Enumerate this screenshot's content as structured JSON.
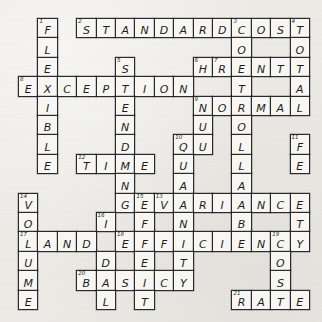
{
  "puzzle": {
    "title": "Accounting Terms Crossword",
    "grid": {
      "cols": 15,
      "rows": 15,
      "cell_size": 19.4,
      "origin_x": 18,
      "origin_y": 18
    },
    "colors": {
      "paper": "#ecebe6",
      "cell": "#f7f6f2",
      "ink": "#1d1d1d",
      "border": "#2a2a2a"
    },
    "entries": [
      {
        "number": 1,
        "direction": "down",
        "answer": "FLEXIBLE",
        "row": 0,
        "col": 1
      },
      {
        "number": 2,
        "direction": "across",
        "answer": "STANDARDCOST",
        "row": 0,
        "col": 3
      },
      {
        "number": 3,
        "direction": "down",
        "answer": "CONTROLLABLE",
        "row": 0,
        "col": 11
      },
      {
        "number": 4,
        "direction": "down",
        "answer": "TOTAL",
        "row": 0,
        "col": 14
      },
      {
        "number": 5,
        "direction": "down",
        "answer": "SPENDING",
        "row": 2,
        "col": 5
      },
      {
        "number": 6,
        "direction": "down",
        "answer": "HOUR",
        "row": 2,
        "col": 9
      },
      {
        "number": 7,
        "direction": "across",
        "answer": "RENT",
        "row": 2,
        "col": 9
      },
      {
        "number": 8,
        "direction": "across",
        "answer": "EXCEPTION",
        "row": 3,
        "col": 0
      },
      {
        "number": 9,
        "direction": "across",
        "answer": "NORMAL",
        "row": 4,
        "col": 9
      },
      {
        "number": 10,
        "direction": "down",
        "answer": "QUANTITY",
        "row": 6,
        "col": 8
      },
      {
        "number": 11,
        "direction": "down",
        "answer": "FEET",
        "row": 6,
        "col": 14
      },
      {
        "number": 12,
        "direction": "across",
        "answer": "TIME",
        "row": 7,
        "col": 3
      },
      {
        "number": 13,
        "direction": "across",
        "answer": "VARIANCE",
        "row": 9,
        "col": 7
      },
      {
        "number": 14,
        "direction": "down",
        "answer": "VOLUME",
        "row": 9,
        "col": 0
      },
      {
        "number": 15,
        "direction": "down",
        "answer": "EFFECT",
        "row": 9,
        "col": 6
      },
      {
        "number": 16,
        "direction": "down",
        "answer": "IDEAL",
        "row": 10,
        "col": 4
      },
      {
        "number": 17,
        "direction": "across",
        "answer": "LAND",
        "row": 11,
        "col": 0
      },
      {
        "number": 18,
        "direction": "across",
        "answer": "EFFICIENCY",
        "row": 11,
        "col": 5
      },
      {
        "number": 19,
        "direction": "down",
        "answer": "COST",
        "row": 11,
        "col": 13
      },
      {
        "number": 20,
        "direction": "across",
        "answer": "BASIC",
        "row": 12,
        "col": 3
      },
      {
        "number": 21,
        "direction": "across",
        "answer": "RATE",
        "row": 13,
        "col": 11
      }
    ],
    "cells": [
      {
        "r": 0,
        "c": 1,
        "l": "F",
        "n": 1
      },
      {
        "r": 0,
        "c": 3,
        "l": "S",
        "n": 2
      },
      {
        "r": 0,
        "c": 4,
        "l": "T"
      },
      {
        "r": 0,
        "c": 5,
        "l": "A"
      },
      {
        "r": 0,
        "c": 6,
        "l": "N"
      },
      {
        "r": 0,
        "c": 7,
        "l": "D"
      },
      {
        "r": 0,
        "c": 8,
        "l": "A"
      },
      {
        "r": 0,
        "c": 9,
        "l": "R"
      },
      {
        "r": 0,
        "c": 10,
        "l": "D"
      },
      {
        "r": 0,
        "c": 11,
        "l": "C",
        "n": 3
      },
      {
        "r": 0,
        "c": 12,
        "l": "O"
      },
      {
        "r": 0,
        "c": 13,
        "l": "S"
      },
      {
        "r": 0,
        "c": 14,
        "l": "T",
        "n": 4
      },
      {
        "r": 1,
        "c": 1,
        "l": "L"
      },
      {
        "r": 1,
        "c": 11,
        "l": "O"
      },
      {
        "r": 1,
        "c": 14,
        "l": "O"
      },
      {
        "r": 2,
        "c": 1,
        "l": "E"
      },
      {
        "r": 2,
        "c": 5,
        "l": "S",
        "n": 5
      },
      {
        "r": 2,
        "c": 9,
        "l": "H",
        "n": 6
      },
      {
        "r": 2,
        "c": 10,
        "l": "R",
        "n": 7
      },
      {
        "r": 2,
        "c": 11,
        "l": "E"
      },
      {
        "r": 2,
        "c": 12,
        "l": "N"
      },
      {
        "r": 2,
        "c": 13,
        "l": "T"
      },
      {
        "r": 2,
        "c": 14,
        "l": "T"
      },
      {
        "r": 3,
        "c": 0,
        "l": "E",
        "n": 8
      },
      {
        "r": 3,
        "c": 1,
        "l": "X"
      },
      {
        "r": 3,
        "c": 2,
        "l": "C"
      },
      {
        "r": 3,
        "c": 3,
        "l": "E"
      },
      {
        "r": 3,
        "c": 4,
        "l": "P"
      },
      {
        "r": 3,
        "c": 5,
        "l": "T"
      },
      {
        "r": 3,
        "c": 6,
        "l": "I"
      },
      {
        "r": 3,
        "c": 7,
        "l": "O"
      },
      {
        "r": 3,
        "c": 8,
        "l": "N"
      },
      {
        "r": 3,
        "c": 11,
        "l": "T"
      },
      {
        "r": 3,
        "c": 14,
        "l": "A"
      },
      {
        "r": 4,
        "c": 1,
        "l": "I"
      },
      {
        "r": 4,
        "c": 5,
        "l": "E"
      },
      {
        "r": 4,
        "c": 9,
        "l": "N",
        "n": 9
      },
      {
        "r": 4,
        "c": 10,
        "l": "O"
      },
      {
        "r": 4,
        "c": 11,
        "l": "R"
      },
      {
        "r": 4,
        "c": 12,
        "l": "M"
      },
      {
        "r": 4,
        "c": 13,
        "l": "A"
      },
      {
        "r": 4,
        "c": 14,
        "l": "L"
      },
      {
        "r": 5,
        "c": 1,
        "l": "B"
      },
      {
        "r": 5,
        "c": 5,
        "l": "N"
      },
      {
        "r": 5,
        "c": 9,
        "l": "U"
      },
      {
        "r": 5,
        "c": 11,
        "l": "O"
      },
      {
        "r": 6,
        "c": 1,
        "l": "L"
      },
      {
        "r": 6,
        "c": 5,
        "l": "D"
      },
      {
        "r": 6,
        "c": 8,
        "l": "Q",
        "n": 10
      },
      {
        "r": 6,
        "c": 9,
        "l": "U"
      },
      {
        "r": 6,
        "c": 11,
        "l": "L"
      },
      {
        "r": 6,
        "c": 14,
        "l": "F",
        "n": 11
      },
      {
        "r": 7,
        "c": 1,
        "l": "E"
      },
      {
        "r": 7,
        "c": 3,
        "l": "T",
        "n": 12
      },
      {
        "r": 7,
        "c": 4,
        "l": "I"
      },
      {
        "r": 7,
        "c": 5,
        "l": "M"
      },
      {
        "r": 7,
        "c": 6,
        "l": "E"
      },
      {
        "r": 7,
        "c": 8,
        "l": "U"
      },
      {
        "r": 7,
        "c": 11,
        "l": "L"
      },
      {
        "r": 7,
        "c": 14,
        "l": "E"
      },
      {
        "r": 8,
        "c": 5,
        "l": "N"
      },
      {
        "r": 8,
        "c": 8,
        "l": "A"
      },
      {
        "r": 8,
        "c": 11,
        "l": "A"
      },
      {
        "r": 9,
        "c": 0,
        "l": "V",
        "n": 14
      },
      {
        "r": 9,
        "c": 5,
        "l": "G"
      },
      {
        "r": 9,
        "c": 6,
        "l": "E",
        "n": 15
      },
      {
        "r": 9,
        "c": 7,
        "l": "V",
        "n": 13
      },
      {
        "r": 9,
        "c": 8,
        "l": "A"
      },
      {
        "r": 9,
        "c": 9,
        "l": "R"
      },
      {
        "r": 9,
        "c": 10,
        "l": "I"
      },
      {
        "r": 9,
        "c": 11,
        "l": "A"
      },
      {
        "r": 9,
        "c": 12,
        "l": "N"
      },
      {
        "r": 9,
        "c": 13,
        "l": "C"
      },
      {
        "r": 9,
        "c": 14,
        "l": "E"
      },
      {
        "r": 10,
        "c": 0,
        "l": "O"
      },
      {
        "r": 10,
        "c": 4,
        "l": "I",
        "n": 16
      },
      {
        "r": 10,
        "c": 6,
        "l": "F"
      },
      {
        "r": 10,
        "c": 8,
        "l": "N"
      },
      {
        "r": 10,
        "c": 11,
        "l": "B"
      },
      {
        "r": 10,
        "c": 14,
        "l": "T"
      },
      {
        "r": 11,
        "c": 0,
        "l": "L",
        "n": 17
      },
      {
        "r": 11,
        "c": 1,
        "l": "A"
      },
      {
        "r": 11,
        "c": 2,
        "l": "N"
      },
      {
        "r": 11,
        "c": 3,
        "l": "D"
      },
      {
        "r": 11,
        "c": 5,
        "l": "E",
        "n": 18
      },
      {
        "r": 11,
        "c": 6,
        "l": "F"
      },
      {
        "r": 11,
        "c": 7,
        "l": "F"
      },
      {
        "r": 11,
        "c": 8,
        "l": "I"
      },
      {
        "r": 11,
        "c": 9,
        "l": "C"
      },
      {
        "r": 11,
        "c": 10,
        "l": "I"
      },
      {
        "r": 11,
        "c": 11,
        "l": "E"
      },
      {
        "r": 11,
        "c": 12,
        "l": "N"
      },
      {
        "r": 11,
        "c": 13,
        "l": "C",
        "n": 19
      },
      {
        "r": 11,
        "c": 14,
        "l": "Y"
      },
      {
        "r": 12,
        "c": 0,
        "l": "U"
      },
      {
        "r": 12,
        "c": 4,
        "l": "D"
      },
      {
        "r": 12,
        "c": 6,
        "l": "E"
      },
      {
        "r": 12,
        "c": 8,
        "l": "T"
      },
      {
        "r": 12,
        "c": 13,
        "l": "O"
      },
      {
        "r": 13,
        "c": 0,
        "l": "M"
      },
      {
        "r": 13,
        "c": 3,
        "l": "B",
        "n": 20
      },
      {
        "r": 13,
        "c": 4,
        "l": "A"
      },
      {
        "r": 13,
        "c": 5,
        "l": "S"
      },
      {
        "r": 13,
        "c": 6,
        "l": "I"
      },
      {
        "r": 13,
        "c": 7,
        "l": "C"
      },
      {
        "r": 13,
        "c": 8,
        "l": "Y"
      },
      {
        "r": 13,
        "c": 13,
        "l": "S"
      },
      {
        "r": 14,
        "c": 0,
        "l": "E"
      },
      {
        "r": 14,
        "c": 4,
        "l": "L"
      },
      {
        "r": 14,
        "c": 6,
        "l": "T"
      },
      {
        "r": 14,
        "c": 11,
        "l": "R",
        "n": 21
      },
      {
        "r": 14,
        "c": 12,
        "l": "A"
      },
      {
        "r": 14,
        "c": 13,
        "l": "T"
      },
      {
        "r": 14,
        "c": 14,
        "l": "E"
      }
    ]
  }
}
